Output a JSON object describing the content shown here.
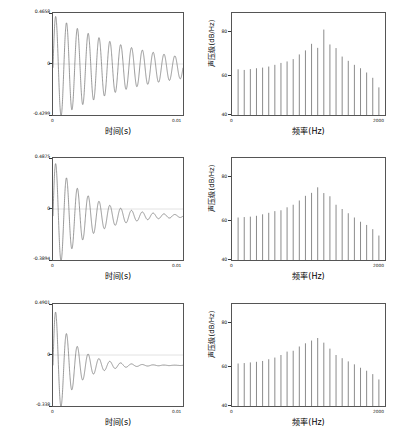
{
  "figure": {
    "background": "#ffffff",
    "trace_color": "#6b6b6b",
    "axis_color": "#555555",
    "rows": 3,
    "cols": 2
  },
  "chart_data": [
    {
      "id": "time-row1",
      "type": "line",
      "title": "",
      "xlabel": "时间(s)",
      "ylabel": "",
      "xlim": [
        0,
        0.01
      ],
      "ylim": [
        -0.4299,
        0.4658
      ],
      "xtick_labels": [
        "0",
        "0.01"
      ],
      "ytick_labels": [
        "0.4658",
        "0",
        "-0.4299"
      ],
      "ytick_values": [
        0.4658,
        0,
        -0.4299
      ],
      "grid": false,
      "legend": "none",
      "annotation": "damped sinusoid, slow decay, ~12 visible cycles",
      "waveform": {
        "amplitude": 0.4658,
        "decay": 160,
        "frequency_hz": 1200,
        "phase_deg": 0,
        "offset": -0.015
      }
    },
    {
      "id": "spectrum-row1",
      "type": "bar",
      "title": "",
      "xlabel": "频率(Hz)",
      "ylabel": "声压级(dB/Hz)",
      "xlim": [
        0,
        2000
      ],
      "ylim": [
        40,
        88
      ],
      "xtick_labels": [
        "0",
        "2000"
      ],
      "ytick_labels": [
        "80",
        "60",
        "40"
      ],
      "ytick_values": [
        80,
        60,
        40
      ],
      "grid": false,
      "legend": "none",
      "x": [
        80,
        160,
        240,
        320,
        400,
        480,
        560,
        640,
        720,
        800,
        880,
        960,
        1040,
        1120,
        1200,
        1280,
        1360,
        1440,
        1520,
        1600,
        1680,
        1760,
        1840,
        1920
      ],
      "values": [
        61.5,
        61.2,
        61.6,
        62.0,
        62.3,
        62.8,
        63.6,
        64.5,
        65.2,
        66.3,
        68.5,
        70.4,
        73.5,
        71.6,
        80.2,
        73.2,
        71.5,
        67.5,
        65.5,
        63.6,
        62.0,
        60.0,
        57.5,
        53.0
      ],
      "baseline": 40
    },
    {
      "id": "time-row2",
      "type": "line",
      "title": "",
      "xlabel": "时间(s)",
      "ylabel": "",
      "xlim": [
        0,
        0.01
      ],
      "ylim": [
        -0.3894,
        0.4875
      ],
      "xtick_labels": [
        "0",
        "0.01"
      ],
      "ytick_labels": [
        "0.4875",
        "0",
        "-0.3894"
      ],
      "ytick_values": [
        0.4875,
        0,
        -0.3894
      ],
      "grid": false,
      "legend": "none",
      "annotation": "damped sinusoid, medium decay, ~7 visible cycles",
      "waveform": {
        "amplitude": 0.4875,
        "decay": 380,
        "frequency_hz": 1200,
        "phase_deg": 0,
        "offset": -0.012
      }
    },
    {
      "id": "spectrum-row2",
      "type": "bar",
      "title": "",
      "xlabel": "频率(Hz)",
      "ylabel": "声压级(dB/Hz)",
      "xlim": [
        0,
        2000
      ],
      "ylim": [
        40,
        88
      ],
      "xtick_labels": [
        "0",
        "2000"
      ],
      "ytick_labels": [
        "80",
        "60",
        "40"
      ],
      "ytick_values": [
        80,
        60,
        40
      ],
      "grid": false,
      "legend": "none",
      "x": [
        80,
        160,
        240,
        320,
        400,
        480,
        560,
        640,
        720,
        800,
        880,
        960,
        1040,
        1120,
        1200,
        1280,
        1360,
        1440,
        1520,
        1600,
        1680,
        1760,
        1840,
        1920
      ],
      "values": [
        60.0,
        60.2,
        60.4,
        60.8,
        61.5,
        62.2,
        63.0,
        63.4,
        64.8,
        66.0,
        68.0,
        70.2,
        71.6,
        74.2,
        71.5,
        70.0,
        66.0,
        64.0,
        62.0,
        60.0,
        58.0,
        56.5,
        54.5,
        51.5
      ],
      "baseline": 40
    },
    {
      "id": "time-row3",
      "type": "line",
      "title": "",
      "xlabel": "时间(s)",
      "ylabel": "",
      "xlim": [
        0,
        0.01
      ],
      "ylim": [
        -0.338,
        0.4901
      ],
      "xtick_labels": [
        "0",
        "0.01"
      ],
      "ytick_labels": [
        "0.4901",
        "0",
        "-0.338"
      ],
      "ytick_values": [
        0.4901,
        0,
        -0.338
      ],
      "grid": false,
      "legend": "none",
      "annotation": "damped sinusoid, fast decay, ~5 visible cycles",
      "waveform": {
        "amplitude": 0.4901,
        "decay": 620,
        "frequency_hz": 1200,
        "phase_deg": 0,
        "offset": -0.008
      }
    },
    {
      "id": "spectrum-row3",
      "type": "bar",
      "title": "",
      "xlabel": "频率(Hz)",
      "ylabel": "声压级(dB/Hz)",
      "xlim": [
        0,
        2000
      ],
      "ylim": [
        40,
        88
      ],
      "xtick_labels": [
        "0",
        "2000"
      ],
      "ytick_labels": [
        "80",
        "60",
        "40"
      ],
      "ytick_values": [
        80,
        60,
        40
      ],
      "grid": false,
      "legend": "none",
      "x": [
        80,
        160,
        240,
        320,
        400,
        480,
        560,
        640,
        720,
        800,
        880,
        960,
        1040,
        1120,
        1200,
        1280,
        1360,
        1440,
        1520,
        1600,
        1680,
        1760,
        1840,
        1920
      ],
      "values": [
        60.0,
        60.2,
        60.5,
        60.8,
        61.2,
        62.0,
        62.8,
        64.0,
        65.6,
        66.0,
        68.0,
        69.5,
        70.8,
        72.0,
        69.8,
        67.0,
        64.0,
        62.5,
        61.0,
        59.6,
        58.0,
        56.6,
        55.0,
        52.5
      ],
      "baseline": 40
    }
  ]
}
